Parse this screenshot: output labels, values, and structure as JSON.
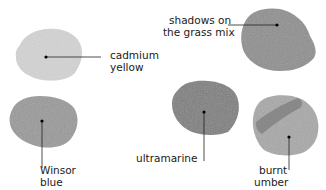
{
  "swatches": [
    {
      "id": "cadmium-yellow",
      "line1": "cadmium",
      "line2": "yellow",
      "color": "#d2d2d2"
    },
    {
      "id": "shadows-grass-mix",
      "line1": "shadows on",
      "line2": "the grass mix",
      "color": "#8e8e8e"
    },
    {
      "id": "winsor-blue",
      "line1": "Winsor",
      "line2": "blue",
      "color": "#9a9a9a"
    },
    {
      "id": "ultramarine",
      "line1": "ultramarine",
      "line2": "",
      "color": "#7e7e7e"
    },
    {
      "id": "burnt-umber",
      "line1": "burnt",
      "line2": "umber",
      "color": "#a6a6a6"
    }
  ]
}
